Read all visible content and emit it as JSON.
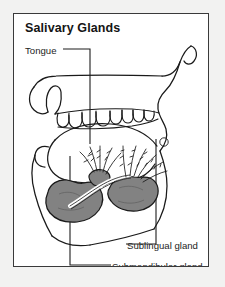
{
  "figure": {
    "title": "Salivary Glands",
    "frame_border_color": "#3a3a3a",
    "page_background": "#f2f2f1",
    "figure_background": "#ffffff"
  },
  "labels": {
    "tongue": "Tongue",
    "sublingual": "Sublingual gland",
    "submandibular": "Submandibular gland"
  },
  "illustration": {
    "type": "anatomical-line-drawing",
    "subject": "sagittal section of human mouth and jaw",
    "outline_color": "#1a1a1a",
    "gland_fill_color": "#828282",
    "gland_outline_color": "#1a1a1a",
    "structures": [
      "head-and-mouth-profile",
      "upper-teeth-row",
      "tongue-body",
      "sublingual-gland",
      "submandibular-gland",
      "salivary-ducts",
      "lower-jaw-contour"
    ],
    "teeth_count": 8,
    "duct_fan_clusters": 2
  }
}
